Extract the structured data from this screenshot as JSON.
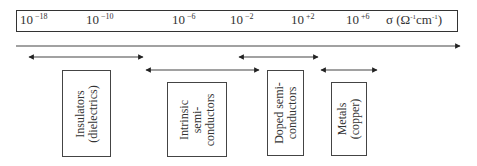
{
  "axis": {
    "ticks": [
      {
        "base": "10",
        "exp": "−18"
      },
      {
        "base": "10",
        "exp": "−10"
      },
      {
        "base": "10",
        "exp": "−6"
      },
      {
        "base": "10",
        "exp": "−2"
      },
      {
        "base": "10",
        "exp": "+2"
      },
      {
        "base": "10",
        "exp": "+6"
      }
    ],
    "unit": {
      "symbol": "σ (Ω",
      "exp1": "-1",
      "mid": "cm",
      "exp2": "-1",
      "close": ")"
    }
  },
  "categories": [
    {
      "id": "insulators",
      "lines": [
        "Insulators",
        "(dielectrics)"
      ],
      "range": [
        "10^-18",
        "10^-10"
      ]
    },
    {
      "id": "intrinsic",
      "lines": [
        "Intrinsic",
        "semi-",
        "conductors"
      ],
      "range": [
        "10^-10",
        "10^-2"
      ]
    },
    {
      "id": "doped",
      "lines": [
        "Doped semi-",
        "conductors"
      ],
      "range": [
        "10^-2",
        "10^+2"
      ]
    },
    {
      "id": "metals",
      "lines": [
        "Metals",
        "(copper)"
      ],
      "range": [
        "10^+2",
        "10^+6"
      ]
    }
  ],
  "colors": {
    "line": "#333333",
    "text": "#2a2a2a",
    "background": "#ffffff"
  }
}
